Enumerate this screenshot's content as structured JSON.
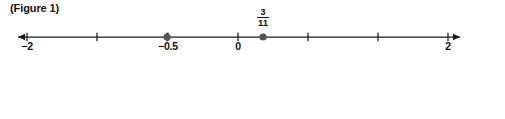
{
  "figures": [
    {
      "caption": "(Figure 1)",
      "line": {
        "x_start": 18,
        "x_end": 460,
        "axis_y": 11,
        "arrow_left": true,
        "arrow_right": true,
        "domain_min": -2.25,
        "domain_max": 2.1,
        "tick_step": 0.5,
        "ticks": [
          {
            "value": -2,
            "x": 27,
            "label": "−2",
            "show_label": true
          },
          {
            "value": -1.5,
            "x": 97,
            "label": "",
            "show_label": false
          },
          {
            "value": -1,
            "x": 167,
            "label": "",
            "show_label": false
          },
          {
            "value": -0.5,
            "x": 168,
            "label": "−0.5",
            "show_label": true
          },
          {
            "value": 0,
            "x": 238,
            "label": "0",
            "show_label": true
          },
          {
            "value": 0.5,
            "x": 308,
            "label": "",
            "show_label": false
          },
          {
            "value": 1,
            "x": 378,
            "label": "",
            "show_label": false
          },
          {
            "value": 2,
            "x": 448,
            "label": "2",
            "show_label": true
          }
        ],
        "tick_positions": [
          27,
          97,
          168,
          238,
          308,
          378,
          448
        ],
        "points": [
          {
            "name": "point-neg-half",
            "x": 167,
            "value": "−0.5",
            "label_type": "none"
          },
          {
            "name": "point-three-elevenths",
            "x": 263,
            "numerator": "3",
            "denominator": "11",
            "label_type": "fraction"
          }
        ]
      }
    },
    {
      "caption": "(Figure 2)",
      "line": {
        "x_start": 18,
        "x_end": 493,
        "axis_y": 11,
        "arrow_left": true,
        "arrow_right": true,
        "domain_min": -4.04,
        "domain_max": -2.975,
        "tick_step": 0.05,
        "ticks": [
          {
            "value": -4,
            "x": 27,
            "label": "−4",
            "show_label": true
          },
          {
            "value": -3.95,
            "x": 49,
            "label": "",
            "show_label": false
          },
          {
            "value": -3.9,
            "x": 72,
            "label": "",
            "show_label": false
          },
          {
            "value": -3.85,
            "x": 94,
            "label": "",
            "show_label": false
          },
          {
            "value": -3.8,
            "x": 117,
            "label": "",
            "show_label": false
          },
          {
            "value": -3.75,
            "x": 139,
            "label": "",
            "show_label": false
          },
          {
            "value": -3.7,
            "x": 162,
            "label": "",
            "show_label": false
          },
          {
            "value": -3.65,
            "x": 184,
            "label": "",
            "show_label": false
          },
          {
            "value": -3.6,
            "x": 207,
            "label": "",
            "show_label": false
          },
          {
            "value": -3.55,
            "x": 229,
            "label": "",
            "show_label": false
          },
          {
            "value": -3.5,
            "x": 252,
            "label": "−3.5",
            "show_label": true
          },
          {
            "value": -3.45,
            "x": 274,
            "label": "",
            "show_label": false
          },
          {
            "value": -3.4,
            "x": 297,
            "label": "",
            "show_label": false
          },
          {
            "value": -3.35,
            "x": 319,
            "label": "",
            "show_label": false
          },
          {
            "value": -3.3,
            "x": 342,
            "label": "",
            "show_label": false
          },
          {
            "value": -3.25,
            "x": 364,
            "label": "",
            "show_label": false
          },
          {
            "value": -3.2,
            "x": 387,
            "label": "",
            "show_label": false
          },
          {
            "value": -3.15,
            "x": 409,
            "label": "",
            "show_label": false
          },
          {
            "value": -3.1,
            "x": 432,
            "label": "",
            "show_label": false
          },
          {
            "value": -3.05,
            "x": 454,
            "label": "",
            "show_label": false
          },
          {
            "value": -3,
            "x": 477,
            "label": "−3",
            "show_label": true
          }
        ],
        "points": []
      }
    }
  ],
  "style": {
    "axis_color": "#1a1a1a",
    "tick_color": "#1a1a1a",
    "point_color": "#555555",
    "text_color": "#111111",
    "background": "#ffffff"
  }
}
